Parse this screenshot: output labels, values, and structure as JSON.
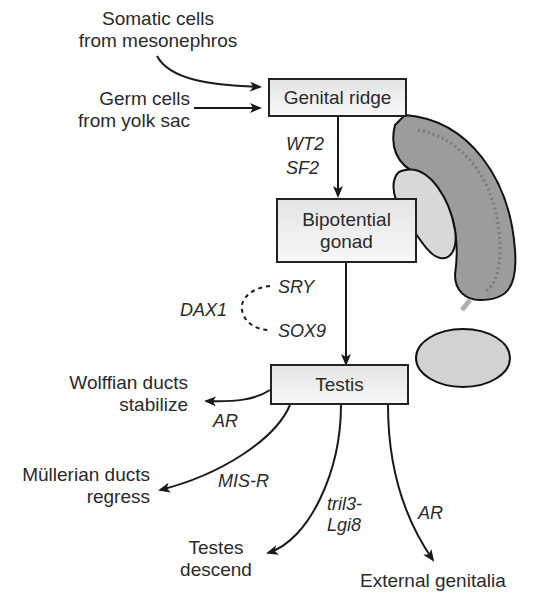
{
  "nodes": {
    "genital_ridge": "Genital ridge",
    "bipotential_gonad_1": "Bipotential",
    "bipotential_gonad_2": "gonad",
    "testis": "Testis"
  },
  "inputs": {
    "somatic_1": "Somatic cells",
    "somatic_2": "from mesonephros",
    "germ_1": "Germ cells",
    "germ_2": "from yolk sac"
  },
  "genes": {
    "wt2": "WT2",
    "sf2": "SF2",
    "sry": "SRY",
    "sox9": "SOX9",
    "dax1": "DAX1",
    "ar_wolffian": "AR",
    "mis_r": "MIS-R",
    "tril3_1": "tril3-",
    "tril3_2": "Lgi8",
    "ar_external": "AR"
  },
  "outcomes": {
    "wolffian_1": "Wolffian ducts",
    "wolffian_2": "stabilize",
    "mullerian_1": "Müllerian ducts",
    "mullerian_2": "regress",
    "testes_1": "Testes",
    "testes_2": "descend",
    "external": "External genitalia"
  },
  "colors": {
    "line": "#1a1a1a",
    "mesonephros_fill": "#9a9a9a",
    "gonad_fill": "#d6d6d6",
    "box_fill": "#eeeeee"
  }
}
